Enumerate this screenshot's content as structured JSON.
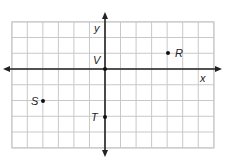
{
  "chart_data": {
    "type": "scatter",
    "title": "",
    "xlabel": "x",
    "ylabel": "y",
    "xlim": [
      -6,
      7
    ],
    "ylim": [
      -5,
      3
    ],
    "grid": true,
    "points": [
      {
        "label": "R",
        "x": 4,
        "y": 1
      },
      {
        "label": "V",
        "x": 0,
        "y": 0
      },
      {
        "label": "S",
        "x": -4,
        "y": -2
      },
      {
        "label": "T",
        "x": 0,
        "y": -3
      }
    ]
  },
  "axes": {
    "x_label": "x",
    "y_label": "y"
  },
  "labels": {
    "R": "R",
    "V": "V",
    "S": "S",
    "T": "T"
  },
  "colors": {
    "grid": "#c8c8c8",
    "axis": "#222222",
    "point": "#111111",
    "background": "#ffffff"
  }
}
